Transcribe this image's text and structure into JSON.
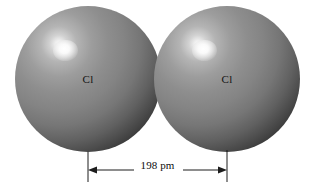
{
  "figure": {
    "kind": "molecular-structure-illustration",
    "background_color": "#ffffff",
    "stroke_color": "#1d1d1d",
    "text_color": "#0d0d0d"
  },
  "atoms": [
    {
      "label": "Cl",
      "name": "chlorine-atom-left",
      "center_x_px": 88,
      "center_y_px": 79,
      "diameter_px": 146,
      "sphere_color_light": "#ffffff",
      "sphere_color_mid": "#8e8e8e",
      "sphere_color_dark": "#060606"
    },
    {
      "label": "Cl",
      "name": "chlorine-atom-right",
      "center_x_px": 227,
      "center_y_px": 79,
      "diameter_px": 146,
      "sphere_color_light": "#ffffff",
      "sphere_color_mid": "#8e8e8e",
      "sphere_color_dark": "#060606"
    }
  ],
  "dimension": {
    "label": "198 pm",
    "value": 198,
    "unit": "pm",
    "measures": "bond length between chlorine nuclei",
    "start_x_px": 88,
    "end_x_px": 227,
    "line_y_px": 170,
    "arrow_direction": "both"
  }
}
